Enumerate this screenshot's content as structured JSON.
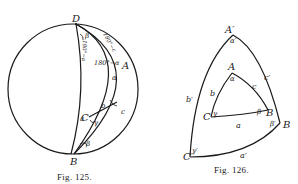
{
  "figures": [
    {
      "id": "fig125",
      "caption": "Fig. 125.",
      "points": {
        "D": "D",
        "A": "A",
        "C": "C",
        "B": "B"
      },
      "labels": {
        "beta_top": "β",
        "arc_180_minus_c": "180°−c",
        "arc_180_minus_a": "180°−a",
        "angle_180_minus_alpha": "180°−α",
        "b": "b",
        "alpha": "α",
        "gamma": "γ",
        "a": "a",
        "c": "c",
        "beta_bottom": "β"
      }
    },
    {
      "id": "fig126",
      "caption": "Fig. 126.",
      "inner_triangle": {
        "vertices": {
          "A": "A",
          "B": "B",
          "C": "C"
        },
        "angles": {
          "alpha": "α",
          "beta": "β",
          "gamma": "γ"
        },
        "sides": {
          "a": "a",
          "b": "b",
          "c": "c"
        }
      },
      "outer_triangle": {
        "vertices": {
          "A": "A′",
          "B": "B",
          "C": "C′"
        },
        "angles": {
          "alpha": "α′",
          "beta": "β′",
          "gamma": "γ′"
        },
        "sides": {
          "a": "a′",
          "b": "b′",
          "c": "c′"
        }
      }
    }
  ]
}
